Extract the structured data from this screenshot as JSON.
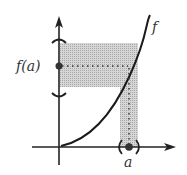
{
  "diagram": {
    "function_label": "f",
    "y_value_label": "f(a)",
    "x_value_label": "a",
    "colors": {
      "ink": "#222222",
      "shade": "#c8c8c8"
    }
  }
}
